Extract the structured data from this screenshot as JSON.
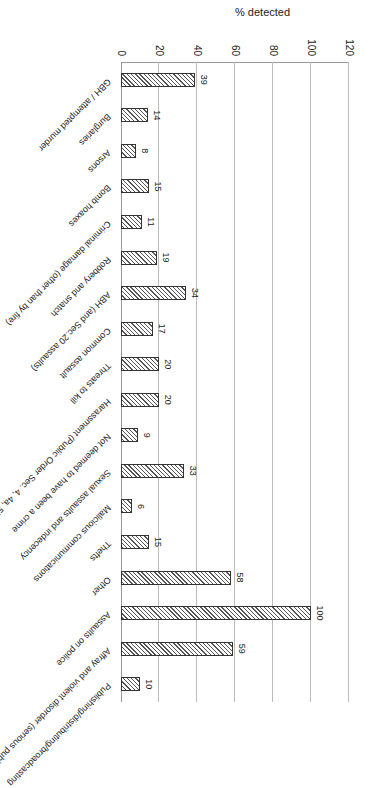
{
  "chart_data": {
    "type": "bar",
    "title": "",
    "xlabel": "",
    "ylabel": "% detected",
    "ylim": [
      0,
      120
    ],
    "yticks": [
      0,
      20,
      40,
      60,
      80,
      100,
      120
    ],
    "grid": true,
    "legend": null,
    "orientation_note": "figure rotated 90 degrees clockwise",
    "categories": [
      "GBH / attempted murder",
      "Burglaries",
      "Arsons",
      "Bomb hoaxes",
      "Criminal damage (other than by fire)",
      "Robbery and snatch",
      "ABH (and Sec.20 assaults)",
      "Common assault",
      "Threats to kill",
      "Harassment (Public Order Sec. 4, 4a, 5)",
      "Not deemed to have been a crime",
      "Sexual assaults and indecency",
      "Malicious communications",
      "Thefts",
      "Other",
      "Assaults on police",
      "Affray and violent disorder (serious public order)",
      "Publishing/distributing/broadcasting"
    ],
    "values": [
      39,
      14,
      8,
      15,
      11,
      19,
      34,
      17,
      20,
      20,
      9,
      33,
      6,
      15,
      58,
      100,
      59,
      10
    ]
  }
}
